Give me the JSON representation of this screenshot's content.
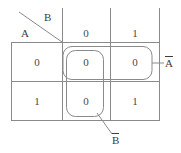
{
  "diagram": {
    "type": "karnaugh-map",
    "line_color": "#8a8a8a",
    "text_color": "#3d3d3d",
    "background": "#ffffff",
    "header": {
      "row_var": "A",
      "col_var": "B",
      "diagonal": true
    },
    "column_headers": [
      "0",
      "1"
    ],
    "row_headers": [
      "0",
      "1"
    ],
    "cells": [
      {
        "row": "0",
        "col": "0",
        "value": "0"
      },
      {
        "row": "0",
        "col": "1",
        "value": "0"
      },
      {
        "row": "1",
        "col": "0",
        "value": "0"
      },
      {
        "row": "1",
        "col": "1",
        "value": "1"
      }
    ],
    "groups": [
      {
        "name": "group-horizontal",
        "label_letter": "A",
        "label_overbar": true,
        "label_text": "Ā",
        "orientation": "horizontal",
        "leader": "right"
      },
      {
        "name": "group-vertical",
        "label_letter": "B",
        "label_overbar": true,
        "label_text": "B̄",
        "orientation": "vertical",
        "leader": "bottom"
      }
    ]
  }
}
